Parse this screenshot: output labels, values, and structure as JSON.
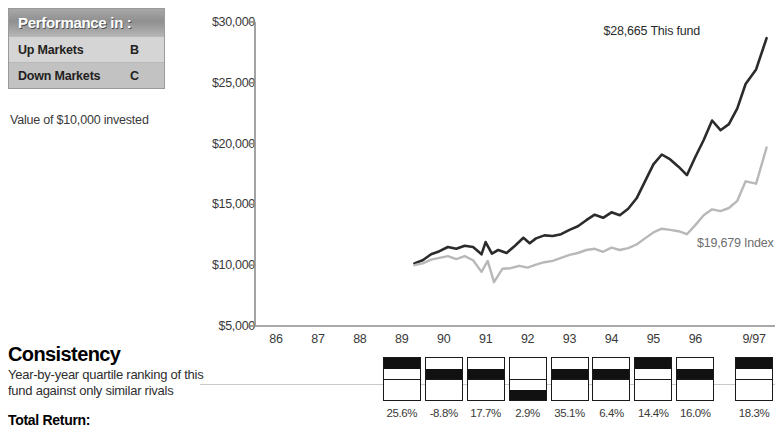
{
  "performance_box": {
    "title": "Performance in :",
    "rows": [
      {
        "label": "Up Markets",
        "grade": "B"
      },
      {
        "label": "Down Markets",
        "grade": "C"
      }
    ],
    "caption": "Value of $10,000 invested"
  },
  "consistency": {
    "heading": "Consistency",
    "description_line1": "Year-by-year quartile ranking of this",
    "description_line2": "fund against only similar rivals",
    "total_return_label": "Total Return:"
  },
  "chart_data": {
    "type": "line",
    "title": "Value of $10,000 invested",
    "xlabel": "",
    "ylabel": "",
    "ylim": [
      5000,
      30000
    ],
    "yticks": [
      5000,
      10000,
      15000,
      20000,
      25000,
      30000
    ],
    "ytick_labels": [
      "$5,000",
      "$10,000",
      "$15,000",
      "$20,000",
      "$25,000",
      "$30,000"
    ],
    "xtick_labels": [
      "86",
      "87",
      "88",
      "89",
      "90",
      "91",
      "92",
      "93",
      "94",
      "95",
      "96",
      "9/97"
    ],
    "grid": false,
    "legend_position": "inline-end-labels",
    "annotations": [
      {
        "text": "$28,665 This fund",
        "value": 28665,
        "series": "This fund"
      },
      {
        "text": "$19,679 Index",
        "value": 19679,
        "series": "Index"
      }
    ],
    "series": [
      {
        "name": "This fund",
        "color": "#2b2b2b",
        "final_value": 28665,
        "x": [
          89.3,
          89.5,
          89.7,
          89.9,
          90.1,
          90.3,
          90.5,
          90.7,
          90.9,
          91.0,
          91.15,
          91.3,
          91.5,
          91.7,
          91.9,
          92.05,
          92.2,
          92.4,
          92.6,
          92.8,
          93.0,
          93.2,
          93.4,
          93.6,
          93.8,
          94.0,
          94.2,
          94.4,
          94.6,
          94.8,
          95.0,
          95.2,
          95.4,
          95.6,
          95.8,
          96.0,
          96.2,
          96.4,
          96.6,
          96.8,
          97.0,
          97.2,
          97.45,
          97.7
        ],
        "values": [
          10150,
          10400,
          10900,
          11150,
          11500,
          11350,
          11600,
          11500,
          10900,
          11900,
          10950,
          11250,
          11000,
          11600,
          12250,
          11800,
          12200,
          12450,
          12400,
          12550,
          12900,
          13200,
          13700,
          14150,
          13900,
          14350,
          14100,
          14650,
          15500,
          16900,
          18300,
          19100,
          18700,
          18100,
          17400,
          18900,
          20300,
          21900,
          21100,
          21600,
          22900,
          24900,
          26100,
          28665
        ]
      },
      {
        "name": "Index",
        "color": "#b8b8b8",
        "final_value": 19679,
        "x": [
          89.3,
          89.5,
          89.7,
          89.9,
          90.1,
          90.3,
          90.5,
          90.7,
          90.9,
          91.05,
          91.2,
          91.4,
          91.6,
          91.8,
          92.0,
          92.2,
          92.4,
          92.6,
          92.8,
          93.0,
          93.2,
          93.4,
          93.6,
          93.8,
          94.0,
          94.2,
          94.4,
          94.6,
          94.8,
          95.0,
          95.2,
          95.4,
          95.6,
          95.8,
          96.0,
          96.2,
          96.4,
          96.6,
          96.8,
          97.0,
          97.2,
          97.45,
          97.7
        ],
        "values": [
          10000,
          10150,
          10450,
          10600,
          10750,
          10500,
          10750,
          10400,
          9450,
          10350,
          8600,
          9700,
          9750,
          9950,
          9800,
          10050,
          10250,
          10350,
          10600,
          10850,
          11000,
          11250,
          11350,
          11100,
          11450,
          11250,
          11400,
          11700,
          12200,
          12700,
          13000,
          12900,
          12800,
          12550,
          13300,
          14100,
          14600,
          14450,
          14700,
          15300,
          16900,
          16700,
          19679
        ]
      }
    ]
  },
  "quartile_chart": {
    "years": [
      "89",
      "90",
      "91",
      "92",
      "93",
      "94",
      "95",
      "96",
      "9/97"
    ],
    "quartiles": [
      1,
      2,
      2,
      4,
      2,
      2,
      1,
      2,
      1
    ],
    "returns": [
      "25.6%",
      "-8.8%",
      "17.7%",
      "2.9%",
      "35.1%",
      "6.4%",
      "14.4%",
      "16.0%",
      "18.3%"
    ]
  }
}
